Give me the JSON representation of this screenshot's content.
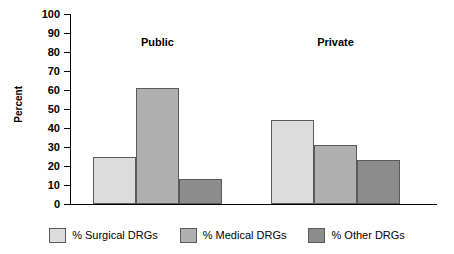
{
  "chart_data": {
    "type": "bar",
    "title": "",
    "subtitle": "",
    "xlabel": "",
    "ylabel": "Percent",
    "ylim": [
      0,
      100
    ],
    "ytick_step": 10,
    "yticks": [
      100,
      90,
      80,
      70,
      60,
      50,
      40,
      30,
      20,
      10,
      0
    ],
    "ytick_labels": [
      "100",
      "90",
      "80",
      "70",
      "60",
      "50",
      "40",
      "30",
      "20",
      "10",
      "0"
    ],
    "grid": false,
    "legend_position": "bottom",
    "categories": [
      "Public",
      "Private"
    ],
    "series": [
      {
        "name": "% Surgical DRGs",
        "color": "#dcdcdc",
        "values": [
          25,
          44
        ]
      },
      {
        "name": "% Medical DRGs",
        "color": "#b0b0b0",
        "values": [
          61,
          31
        ]
      },
      {
        "name": "% Other DRGs",
        "color": "#8c8c8c",
        "values": [
          13,
          23
        ]
      }
    ],
    "annotations": []
  },
  "legend": {
    "items": [
      {
        "label": "% Surgical DRGs",
        "color": "#dcdcdc"
      },
      {
        "label": "% Medical DRGs",
        "color": "#b0b0b0"
      },
      {
        "label": "% Other DRGs",
        "color": "#8c8c8c"
      }
    ]
  },
  "axis": {
    "y_title": "Percent"
  },
  "groups": [
    {
      "label": "Public"
    },
    {
      "label": "Private"
    }
  ]
}
